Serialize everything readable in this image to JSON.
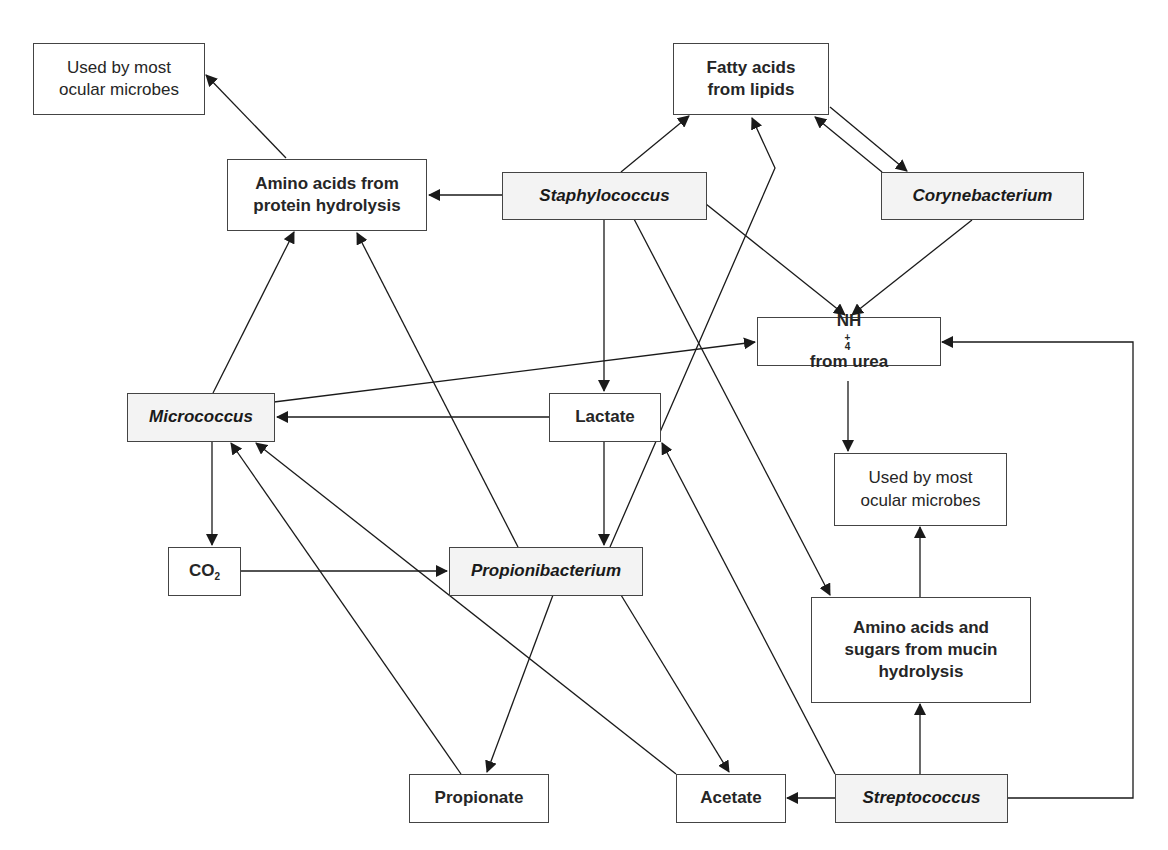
{
  "diagram": {
    "type": "metabolic-interaction-network",
    "nodes": {
      "used_left": {
        "line1": "Used by most",
        "line2": "ocular microbes",
        "kind": "product"
      },
      "amino_protein": {
        "line1": "Amino acids from",
        "line2": "protein hydrolysis",
        "kind": "substrate"
      },
      "fatty_acids": {
        "line1": "Fatty acids",
        "line2": "from lipids",
        "kind": "substrate"
      },
      "staphylococcus": {
        "label": "Staphylococcus",
        "kind": "organism"
      },
      "corynebacterium": {
        "label": "Corynebacterium",
        "kind": "organism"
      },
      "nh4": {
        "base": "NH",
        "sub": "4",
        "sup": "+",
        "rest": "from urea",
        "kind": "substrate"
      },
      "micrococcus": {
        "label": "Micrococcus",
        "kind": "organism"
      },
      "lactate": {
        "label": "Lactate",
        "kind": "metabolite"
      },
      "used_right": {
        "line1": "Used by most",
        "line2": "ocular microbes",
        "kind": "product"
      },
      "co2": {
        "base": "CO",
        "sub": "2",
        "kind": "metabolite"
      },
      "propionibacterium": {
        "label": "Propionibacterium",
        "kind": "organism"
      },
      "amino_mucin": {
        "line1": "Amino acids and",
        "line2": "sugars from mucin",
        "line3": "hydrolysis",
        "kind": "substrate"
      },
      "propionate": {
        "label": "Propionate",
        "kind": "metabolite"
      },
      "acetate": {
        "label": "Acetate",
        "kind": "metabolite"
      },
      "streptococcus": {
        "label": "Streptococcus",
        "kind": "organism"
      }
    },
    "edges": [
      {
        "from": "Amino acids from protein hydrolysis",
        "to": "Used by most ocular microbes (left)"
      },
      {
        "from": "Staphylococcus",
        "to": "Amino acids from protein hydrolysis"
      },
      {
        "from": "Staphylococcus",
        "to": "Fatty acids from lipids"
      },
      {
        "from": "Staphylococcus",
        "to": "Lactate"
      },
      {
        "from": "Staphylococcus",
        "to": "NH4+ from urea"
      },
      {
        "from": "Staphylococcus",
        "to": "Amino acids and sugars from mucin hydrolysis"
      },
      {
        "from": "Fatty acids from lipids",
        "to": "Corynebacterium"
      },
      {
        "from": "Corynebacterium",
        "to": "Fatty acids from lipids"
      },
      {
        "from": "Corynebacterium",
        "to": "NH4+ from urea"
      },
      {
        "from": "Micrococcus",
        "to": "Amino acids from protein hydrolysis"
      },
      {
        "from": "Micrococcus",
        "to": "NH4+ from urea"
      },
      {
        "from": "Micrococcus",
        "to": "CO2"
      },
      {
        "from": "Lactate",
        "to": "Micrococcus"
      },
      {
        "from": "Lactate",
        "to": "Propionibacterium"
      },
      {
        "from": "CO2",
        "to": "Propionibacterium"
      },
      {
        "from": "Propionibacterium",
        "to": "Amino acids from protein hydrolysis"
      },
      {
        "from": "Propionibacterium",
        "to": "Fatty acids from lipids"
      },
      {
        "from": "Propionibacterium",
        "to": "Propionate"
      },
      {
        "from": "Propionibacterium",
        "to": "Acetate"
      },
      {
        "from": "Propionate",
        "to": "Micrococcus"
      },
      {
        "from": "Acetate",
        "to": "Micrococcus"
      },
      {
        "from": "NH4+ from urea",
        "to": "Used by most ocular microbes (right)"
      },
      {
        "from": "Amino acids and sugars from mucin hydrolysis",
        "to": "Used by most ocular microbes (right)"
      },
      {
        "from": "Streptococcus",
        "to": "Amino acids and sugars from mucin hydrolysis"
      },
      {
        "from": "Streptococcus",
        "to": "Acetate"
      },
      {
        "from": "Streptococcus",
        "to": "Lactate"
      },
      {
        "from": "Streptococcus",
        "to": "NH4+ from urea"
      }
    ],
    "colors": {
      "line": "#1a1a1a",
      "box_border": "#444444",
      "organism_fill": "#f3f3f3",
      "text": "#262626"
    }
  }
}
